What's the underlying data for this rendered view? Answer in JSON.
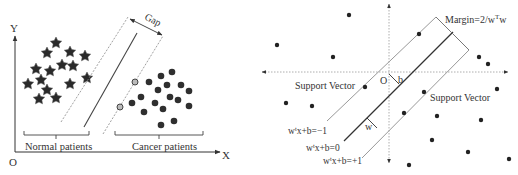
{
  "left_panel": {
    "axis_y_label": "Y",
    "axis_x_label": "X",
    "origin_label": "O",
    "gap_label": "Gap",
    "group_left_label": "Normal patients",
    "group_right_label": "Cancer patients"
  },
  "right_panel": {
    "margin_label": "Margin=2/w",
    "margin_label_sup": "T",
    "margin_label_tail": "w",
    "origin_label": "O",
    "bias_label": "b",
    "normal_label": "w",
    "support_vector_left": "Support Vector",
    "support_vector_right": "Support Vector",
    "eq_minus": "w",
    "eq_minus_sup": "t",
    "eq_minus_tail": "x+b=−1",
    "eq_zero": "w",
    "eq_zero_sup": "t",
    "eq_zero_tail": "x+b=0",
    "eq_plus": "w",
    "eq_plus_sup": "t",
    "eq_plus_tail": "x+b=+1"
  },
  "colors": {
    "ink": "#333333",
    "marker": "#2a2a2a",
    "gray_line": "#9a9a9a",
    "dotted": "#999999"
  }
}
